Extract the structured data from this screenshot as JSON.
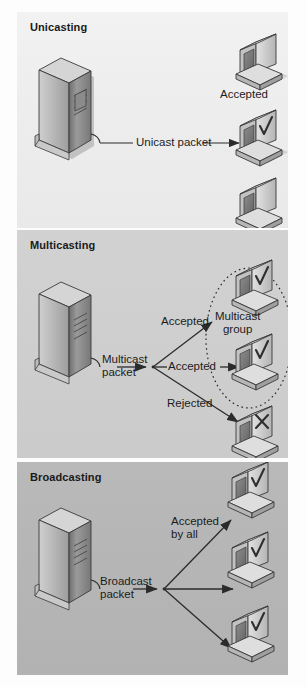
{
  "figure": {
    "colors": {
      "panel_unicast_bg": "#ededed",
      "panel_multicast_bg": "#cfcfcf",
      "panel_broadcast_bg": "#b6b6b6",
      "line": "#2b2b2b",
      "text": "#1c1c1c",
      "device_light": "#e8e8e8",
      "device_mid": "#b0b0b0",
      "device_dark": "#7d7d7d",
      "device_outline": "#3a3a3a"
    }
  },
  "panels": [
    {
      "id": "unicast",
      "title": "Unicasting",
      "server": {
        "name": "server-tower"
      },
      "packet_label": "Unicast packet",
      "clients": [
        {
          "id": "u1",
          "state": "none",
          "label": ""
        },
        {
          "id": "u2",
          "state": "accepted",
          "label": "Accepted"
        },
        {
          "id": "u3",
          "state": "none",
          "label": ""
        }
      ],
      "arrow_labels": [
        "Unicast packet"
      ],
      "status_labels": [
        "Accepted"
      ]
    },
    {
      "id": "multicast",
      "title": "Multicasting",
      "server": {
        "name": "server-tower"
      },
      "packet_label_line1": "Multicast",
      "packet_label_line2": "packet",
      "group_label_line1": "Multicast",
      "group_label_line2": "group",
      "branch_labels": [
        "Accepted",
        "Accepted",
        "Rejected"
      ],
      "clients": [
        {
          "id": "m1",
          "state": "accepted",
          "label": "Accepted"
        },
        {
          "id": "m2",
          "state": "accepted",
          "label": "Accepted"
        },
        {
          "id": "m3",
          "state": "rejected",
          "label": "Rejected"
        }
      ]
    },
    {
      "id": "broadcast",
      "title": "Broadcasting",
      "server": {
        "name": "server-tower"
      },
      "packet_label_line1": "Broadcast",
      "packet_label_line2": "packet",
      "accept_label_line1": "Accepted",
      "accept_label_line2": "by all",
      "clients": [
        {
          "id": "b1",
          "state": "accepted"
        },
        {
          "id": "b2",
          "state": "accepted"
        },
        {
          "id": "b3",
          "state": "accepted"
        }
      ]
    }
  ]
}
